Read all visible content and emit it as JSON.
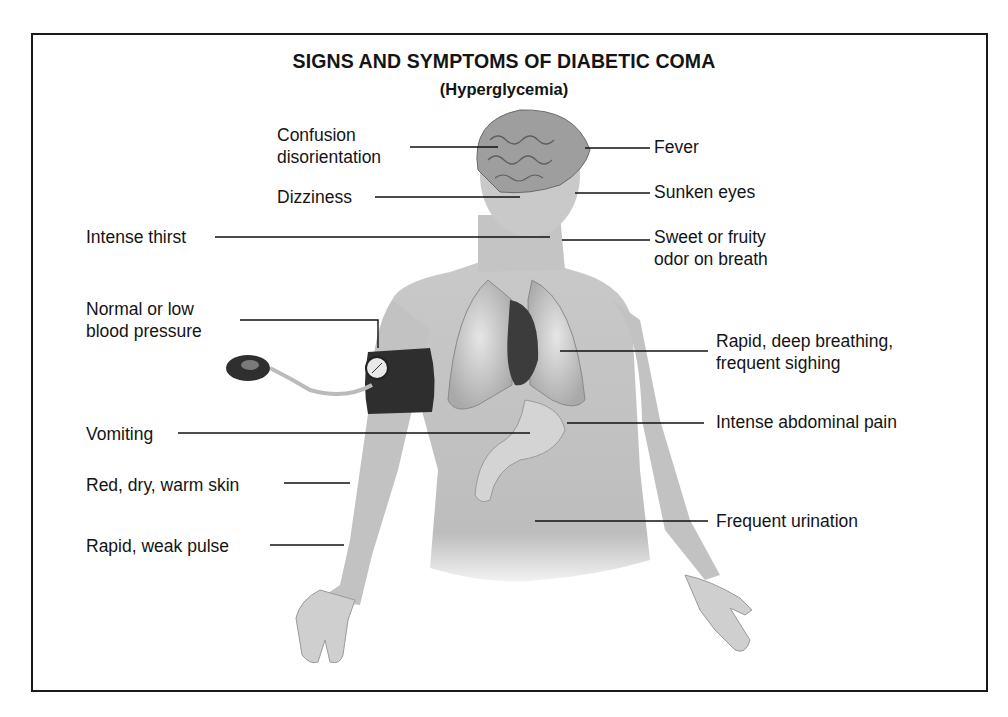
{
  "diagram": {
    "title": "SIGNS AND SYMPTOMS OF DIABETIC COMA",
    "subtitle": "(Hyperglycemia)",
    "figure": "human-torso-illustration",
    "labels_left": [
      {
        "id": "confusion",
        "lines": [
          "Confusion",
          "disorientation"
        ]
      },
      {
        "id": "dizziness",
        "lines": [
          "Dizziness"
        ]
      },
      {
        "id": "thirst",
        "lines": [
          "Intense thirst"
        ]
      },
      {
        "id": "blood-pressure",
        "lines": [
          "Normal or low",
          "blood pressure"
        ]
      },
      {
        "id": "vomiting",
        "lines": [
          "Vomiting"
        ]
      },
      {
        "id": "skin",
        "lines": [
          "Red, dry, warm skin"
        ]
      },
      {
        "id": "pulse",
        "lines": [
          "Rapid, weak pulse"
        ]
      }
    ],
    "labels_right": [
      {
        "id": "fever",
        "lines": [
          "Fever"
        ]
      },
      {
        "id": "eyes",
        "lines": [
          "Sunken eyes"
        ]
      },
      {
        "id": "breath-odor",
        "lines": [
          "Sweet or fruity",
          "odor on breath"
        ]
      },
      {
        "id": "breathing",
        "lines": [
          "Rapid, deep breathing,",
          "frequent sighing"
        ]
      },
      {
        "id": "abdominal-pain",
        "lines": [
          "Intense abdominal pain"
        ]
      },
      {
        "id": "urination",
        "lines": [
          "Frequent urination"
        ]
      }
    ]
  }
}
